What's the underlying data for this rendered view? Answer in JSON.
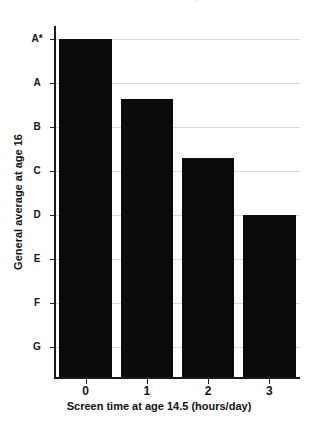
{
  "chart_data": {
    "type": "bar",
    "title": "Screen time and school grades",
    "xlabel": "Screen time at age 14.5 (hours/day)",
    "ylabel": "General average at age 16",
    "categories": [
      "0",
      "1",
      "2",
      "3"
    ],
    "values": [
      8.0,
      6.65,
      5.3,
      4.0
    ],
    "value_grades": [
      "A*",
      "B",
      "C-",
      "D-"
    ],
    "ytick_labels": [
      "A*",
      "A",
      "B",
      "C",
      "D",
      "E",
      "F",
      "G"
    ],
    "ytick_values": [
      8,
      7,
      6,
      5,
      4,
      3,
      2,
      1
    ],
    "ylim": [
      0.3,
      8.3
    ],
    "grid": true,
    "grid_axis": "y",
    "legend": null,
    "bar_color": "#0b0b0b",
    "grid_color": "#d8d8d8",
    "axis_color": "#1a1a1a",
    "orientation": "vertical"
  },
  "axes": {
    "y_ticks": [
      {
        "label": "A*",
        "value": 8
      },
      {
        "label": "A",
        "value": 7
      },
      {
        "label": "B",
        "value": 6
      },
      {
        "label": "C",
        "value": 5
      },
      {
        "label": "D",
        "value": 4
      },
      {
        "label": "E",
        "value": 3
      },
      {
        "label": "F",
        "value": 2
      },
      {
        "label": "G",
        "value": 1
      }
    ],
    "x_ticks": [
      {
        "label": "0",
        "value": 0
      },
      {
        "label": "1",
        "value": 1
      },
      {
        "label": "2",
        "value": 2
      },
      {
        "label": "3",
        "value": 3
      }
    ],
    "x_title": "Screen time at age 14.5 (hours/day)",
    "y_title": "General average at age 16"
  }
}
